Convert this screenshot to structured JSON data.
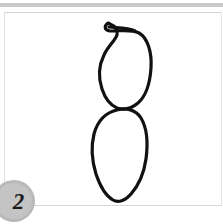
{
  "window": {
    "background_color": "#ffffff",
    "top_band_color": "#c9c9c9"
  },
  "canvas": {
    "name": "drawing-canvas",
    "background_color": "#ffffff",
    "border_color": "#d8d8d8",
    "stroke_color": "#111111",
    "stroke_width": 3.2,
    "description": "hand-drawn outline of two stacked lobes joined at a narrow waist, with a curled hook at the top"
  },
  "drawing": {
    "upper_lobe": {
      "name": "upper-lobe-with-hook",
      "path": "M 103 10 C 99 13 99 17 105 18 C 116 18 127 16 134 20 C 143 25 147 40 146 55 C 145 70 141 83 133 90 C 126 96 118 97 112 95 C 105 92 100 85 97 76 C 93 64 94 52 99 42 C 103 33 110 28 112 22 C 113 17 110 13 105 11 C 104 10 103 10 103 10 Z"
    },
    "hook_inner": {
      "name": "hook-inner-curl",
      "path": "M 104 14 C 110 15 121 14 129 17"
    },
    "lower_lobe": {
      "name": "lower-lobe",
      "path": "M 112 97 C 121 94 131 97 136 105 C 142 115 143 131 141 146 C 139 160 133 173 126 181 C 120 188 113 190 108 187 C 101 183 95 173 91 161 C 87 148 86 133 89 121 C 92 110 99 100 112 97 Z"
    }
  },
  "badge": {
    "name": "page-number-badge",
    "number": "2",
    "fill_color": "#c4c4c4",
    "text_color": "#1b1b1b"
  }
}
